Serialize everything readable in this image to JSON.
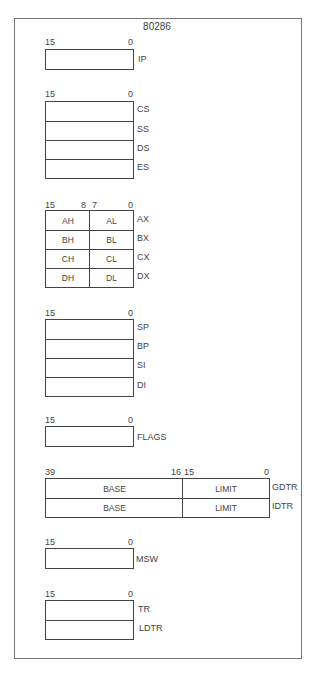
{
  "title": "80286",
  "groups": {
    "ip": {
      "bits": {
        "high": "15",
        "low": "0"
      },
      "registers": [
        "IP"
      ]
    },
    "segment": {
      "bits": {
        "high": "15",
        "low": "0"
      },
      "registers": [
        "CS",
        "SS",
        "DS",
        "ES"
      ]
    },
    "general": {
      "bits": {
        "b15": "15",
        "b8": "8",
        "b7": "7",
        "b0": "0"
      },
      "rows": [
        {
          "high": "AH",
          "low": "AL",
          "name": "AX"
        },
        {
          "high": "BH",
          "low": "BL",
          "name": "BX"
        },
        {
          "high": "CH",
          "low": "CL",
          "name": "CX"
        },
        {
          "high": "DH",
          "low": "DL",
          "name": "DX"
        }
      ]
    },
    "pointer_index": {
      "bits": {
        "high": "15",
        "low": "0"
      },
      "registers": [
        "SP",
        "BP",
        "SI",
        "DI"
      ]
    },
    "flags": {
      "bits": {
        "high": "15",
        "low": "0"
      },
      "registers": [
        "FLAGS"
      ]
    },
    "descriptor_tables": {
      "bits": {
        "b39": "39",
        "b16": "16",
        "b15": "15",
        "b0": "0"
      },
      "rows": [
        {
          "base": "BASE",
          "limit": "LIMIT",
          "name": "GDTR"
        },
        {
          "base": "BASE",
          "limit": "LIMIT",
          "name": "IDTR"
        }
      ]
    },
    "msw": {
      "bits": {
        "high": "15",
        "low": "0"
      },
      "registers": [
        "MSW"
      ]
    },
    "task": {
      "bits": {
        "high": "15",
        "low": "0"
      },
      "registers": [
        "TR",
        "LDTR"
      ]
    }
  }
}
